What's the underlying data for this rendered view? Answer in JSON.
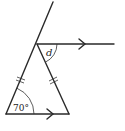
{
  "diagram": {
    "type": "geometry",
    "labels": {
      "angle_unknown": "d",
      "angle_known": "70°"
    },
    "markers": {
      "equal_sides": "double tick marks on both slanted sides",
      "parallel_lines": "single arrow on top ray and on triangle base"
    },
    "colors": {
      "stroke": "#2a2a2a",
      "background": "#ffffff"
    }
  }
}
